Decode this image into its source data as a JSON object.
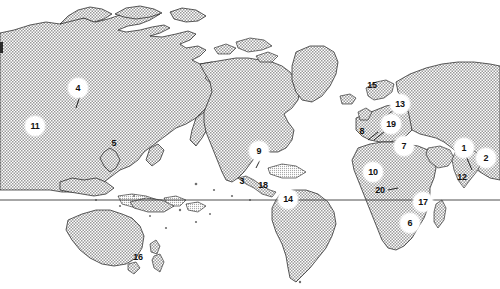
{
  "figure": {
    "kind": "world-map",
    "projection": "pacific-centered-world",
    "width": 500,
    "height": 289,
    "background_color": "#ffffff",
    "land_fill_color": "#b4b4b4",
    "land_stroke_color": "#1a1a1a",
    "equator_line_color": "#333333",
    "marker_text_color": "#111111",
    "marker_halo_color": "#ffffff"
  },
  "equator": {
    "label": "equator-line",
    "y": 200,
    "x_start": 0,
    "x_end": 500
  },
  "markers": [
    {
      "id": "m1",
      "label": "1",
      "x": 464,
      "y": 148,
      "style": "halo",
      "region": "south-asia",
      "leader": "M464,155 L470,168"
    },
    {
      "id": "m2",
      "label": "2",
      "x": 486,
      "y": 158,
      "style": "halo",
      "region": "bay-of-bengal",
      "leader": ""
    },
    {
      "id": "m3",
      "label": "3",
      "x": 242,
      "y": 181,
      "style": "plain",
      "region": "mexico",
      "leader": ""
    },
    {
      "id": "m4",
      "label": "4",
      "x": 78,
      "y": 88,
      "style": "halo",
      "region": "central-siberia",
      "leader": "M78,97 L75,107"
    },
    {
      "id": "m5",
      "label": "5",
      "x": 114,
      "y": 143,
      "style": "plain",
      "region": "japan",
      "leader": ""
    },
    {
      "id": "m6",
      "label": "6",
      "x": 410,
      "y": 223,
      "style": "halo",
      "region": "southern-africa",
      "leader": ""
    },
    {
      "id": "m7",
      "label": "7",
      "x": 404,
      "y": 146,
      "style": "halo",
      "region": "turkey",
      "leader": ""
    },
    {
      "id": "m8",
      "label": "8",
      "x": 362,
      "y": 131,
      "style": "plain",
      "region": "iberia",
      "leader": ""
    },
    {
      "id": "m9",
      "label": "9",
      "x": 259,
      "y": 151,
      "style": "halo",
      "region": "united-states",
      "leader": ""
    },
    {
      "id": "m10",
      "label": "10",
      "x": 373,
      "y": 172,
      "style": "halo",
      "region": "west-africa",
      "leader": ""
    },
    {
      "id": "m11",
      "label": "11",
      "x": 35,
      "y": 126,
      "style": "halo",
      "region": "west-siberia",
      "leader": ""
    },
    {
      "id": "m12",
      "label": "12",
      "x": 462,
      "y": 177,
      "style": "plain",
      "region": "india",
      "leader": ""
    },
    {
      "id": "m13",
      "label": "13",
      "x": 400,
      "y": 104,
      "style": "halo",
      "region": "denmark",
      "leader": "M393,108 L385,114"
    },
    {
      "id": "m14",
      "label": "14",
      "x": 288,
      "y": 199,
      "style": "halo",
      "region": "northern-andes",
      "leader": ""
    },
    {
      "id": "m15",
      "label": "15",
      "x": 372,
      "y": 85,
      "style": "plain",
      "region": "norway",
      "leader": ""
    },
    {
      "id": "m16",
      "label": "16",
      "x": 138,
      "y": 257,
      "style": "plain",
      "region": "new-zealand",
      "leader": ""
    },
    {
      "id": "m17",
      "label": "17",
      "x": 423,
      "y": 202,
      "style": "halo",
      "region": "east-africa",
      "leader": ""
    },
    {
      "id": "m18",
      "label": "18",
      "x": 263,
      "y": 185,
      "style": "plain",
      "region": "central-america",
      "leader": ""
    },
    {
      "id": "m19",
      "label": "19",
      "x": 391,
      "y": 124,
      "style": "halo",
      "region": "central-europe",
      "leader": ""
    },
    {
      "id": "m20",
      "label": "20",
      "x": 380,
      "y": 190,
      "style": "plain",
      "region": "gulf-of-guinea",
      "leader": ""
    }
  ],
  "landmasses": [
    {
      "name": "eurasia-west-pacific-sheet"
    },
    {
      "name": "north-america"
    },
    {
      "name": "south-america"
    },
    {
      "name": "africa"
    },
    {
      "name": "europe"
    },
    {
      "name": "greenland"
    },
    {
      "name": "australia"
    },
    {
      "name": "new-zealand"
    },
    {
      "name": "japan"
    },
    {
      "name": "madagascar"
    },
    {
      "name": "indonesia-archipelago"
    },
    {
      "name": "iceland"
    },
    {
      "name": "great-britain"
    },
    {
      "name": "arabian-peninsula"
    },
    {
      "name": "india-subcontinent"
    }
  ]
}
